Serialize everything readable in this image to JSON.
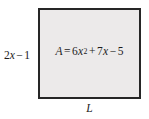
{
  "figure": {
    "type": "geometry-rectangle-diagram",
    "background_color": "#ffffff",
    "rectangle": {
      "fill_color": "#eceaea",
      "border_color": "#262626",
      "border_width_px": 2,
      "x": 38,
      "y": 8,
      "width": 103,
      "height": 91
    },
    "labels": {
      "height_label": {
        "text": "2x − 1",
        "parts": {
          "coefficient": "2",
          "variable": "x",
          "operator": "−",
          "constant": "1"
        },
        "position": "left-of-rectangle"
      },
      "width_label": {
        "text": "L",
        "position": "below-rectangle"
      },
      "area_formula": {
        "text": "A = 6x² + 7x − 5",
        "parts": {
          "area_symbol": "A",
          "equals": "=",
          "quadratic_coefficient": "6",
          "quadratic_variable": "x",
          "quadratic_exponent": "2",
          "first_operator": "+",
          "linear_coefficient": "7",
          "linear_variable": "x",
          "second_operator": "−",
          "constant_term": "5"
        },
        "position": "inside-rectangle"
      }
    },
    "text_color": "#1c1c1c"
  }
}
